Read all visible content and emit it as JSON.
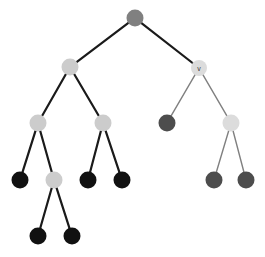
{
  "figure": {
    "type": "node-link-tree-diagram",
    "width": 265,
    "height": 257,
    "background_color": "#ffffff"
  },
  "palette": {
    "node_black": "#111111",
    "node_dark_gray": "#4d4d4d",
    "node_mid_gray": "#808080",
    "node_light_gray": "#cccccc",
    "edge_black": "#1a1a1a",
    "edge_gray": "#808080",
    "label_color": "#3a3a3a"
  },
  "chart_data": {
    "type": "tree",
    "title": "",
    "xlabel": "",
    "ylabel": "",
    "nodes": [
      {
        "id": "n0",
        "label": "",
        "x": 135,
        "y": 18,
        "r": 8.5,
        "fill": "#808080",
        "level": 0
      },
      {
        "id": "n1",
        "label": "",
        "x": 70,
        "y": 67,
        "r": 8.5,
        "fill": "#cccccc",
        "level": 1
      },
      {
        "id": "n2",
        "label": "v",
        "x": 199,
        "y": 68,
        "r": 8.0,
        "fill": "#dcdcdc",
        "level": 1
      },
      {
        "id": "n3",
        "label": "",
        "x": 38,
        "y": 123,
        "r": 8.5,
        "fill": "#cccccc",
        "level": 2
      },
      {
        "id": "n4",
        "label": "",
        "x": 103,
        "y": 123,
        "r": 8.5,
        "fill": "#cccccc",
        "level": 2
      },
      {
        "id": "n5",
        "label": "",
        "x": 167,
        "y": 123,
        "r": 8.5,
        "fill": "#4d4d4d",
        "level": 2
      },
      {
        "id": "n6",
        "label": "",
        "x": 231,
        "y": 123,
        "r": 8.5,
        "fill": "#dcdcdc",
        "level": 2
      },
      {
        "id": "n7",
        "label": "",
        "x": 20,
        "y": 180,
        "r": 8.5,
        "fill": "#111111",
        "level": 3
      },
      {
        "id": "n8",
        "label": "",
        "x": 54,
        "y": 180,
        "r": 8.5,
        "fill": "#cccccc",
        "level": 3
      },
      {
        "id": "n9",
        "label": "",
        "x": 88,
        "y": 180,
        "r": 8.5,
        "fill": "#111111",
        "level": 3
      },
      {
        "id": "n10",
        "label": "",
        "x": 122,
        "y": 180,
        "r": 8.5,
        "fill": "#111111",
        "level": 3
      },
      {
        "id": "n11",
        "label": "",
        "x": 214,
        "y": 180,
        "r": 8.5,
        "fill": "#4d4d4d",
        "level": 3
      },
      {
        "id": "n12",
        "label": "",
        "x": 246,
        "y": 180,
        "r": 8.5,
        "fill": "#4d4d4d",
        "level": 3
      },
      {
        "id": "n13",
        "label": "",
        "x": 38,
        "y": 236,
        "r": 8.5,
        "fill": "#111111",
        "level": 4
      },
      {
        "id": "n14",
        "label": "",
        "x": 72,
        "y": 236,
        "r": 8.5,
        "fill": "#111111",
        "level": 4
      }
    ],
    "edges": [
      {
        "from": "n0",
        "to": "n1",
        "color": "#1a1a1a",
        "width": 2.2
      },
      {
        "from": "n0",
        "to": "n2",
        "color": "#1a1a1a",
        "width": 2.2
      },
      {
        "from": "n1",
        "to": "n3",
        "color": "#1a1a1a",
        "width": 2.2
      },
      {
        "from": "n1",
        "to": "n4",
        "color": "#1a1a1a",
        "width": 2.2
      },
      {
        "from": "n2",
        "to": "n5",
        "color": "#808080",
        "width": 1.4
      },
      {
        "from": "n2",
        "to": "n6",
        "color": "#808080",
        "width": 1.4
      },
      {
        "from": "n3",
        "to": "n7",
        "color": "#1a1a1a",
        "width": 2.2
      },
      {
        "from": "n3",
        "to": "n8",
        "color": "#1a1a1a",
        "width": 2.2
      },
      {
        "from": "n4",
        "to": "n9",
        "color": "#1a1a1a",
        "width": 2.2
      },
      {
        "from": "n4",
        "to": "n10",
        "color": "#1a1a1a",
        "width": 2.2
      },
      {
        "from": "n6",
        "to": "n11",
        "color": "#808080",
        "width": 1.4
      },
      {
        "from": "n6",
        "to": "n12",
        "color": "#808080",
        "width": 1.4
      },
      {
        "from": "n8",
        "to": "n13",
        "color": "#1a1a1a",
        "width": 2.2
      },
      {
        "from": "n8",
        "to": "n14",
        "color": "#1a1a1a",
        "width": 2.2
      }
    ],
    "legend": [],
    "annotations": [
      {
        "text": "v",
        "node": "n2"
      }
    ]
  }
}
